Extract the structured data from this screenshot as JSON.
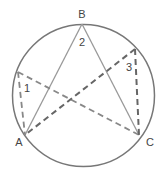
{
  "diagram": {
    "type": "inscribed-angles-circle",
    "circle": {
      "cx": 83.5,
      "cy": 95.5,
      "r": 71
    },
    "colors": {
      "circle": "#777777",
      "solid": "#999999",
      "dashed": "#777777",
      "label": "#444444"
    },
    "points": {
      "A": {
        "x": 25,
        "y": 135
      },
      "B": {
        "x": 82,
        "y": 24
      },
      "C": {
        "x": 139,
        "y": 135
      },
      "P1": {
        "x": 18,
        "y": 72
      },
      "P3": {
        "x": 135,
        "y": 49
      }
    },
    "labels": {
      "A": "A",
      "B": "B",
      "C": "C",
      "angle1": "1",
      "angle2": "2",
      "angle3": "3"
    }
  }
}
